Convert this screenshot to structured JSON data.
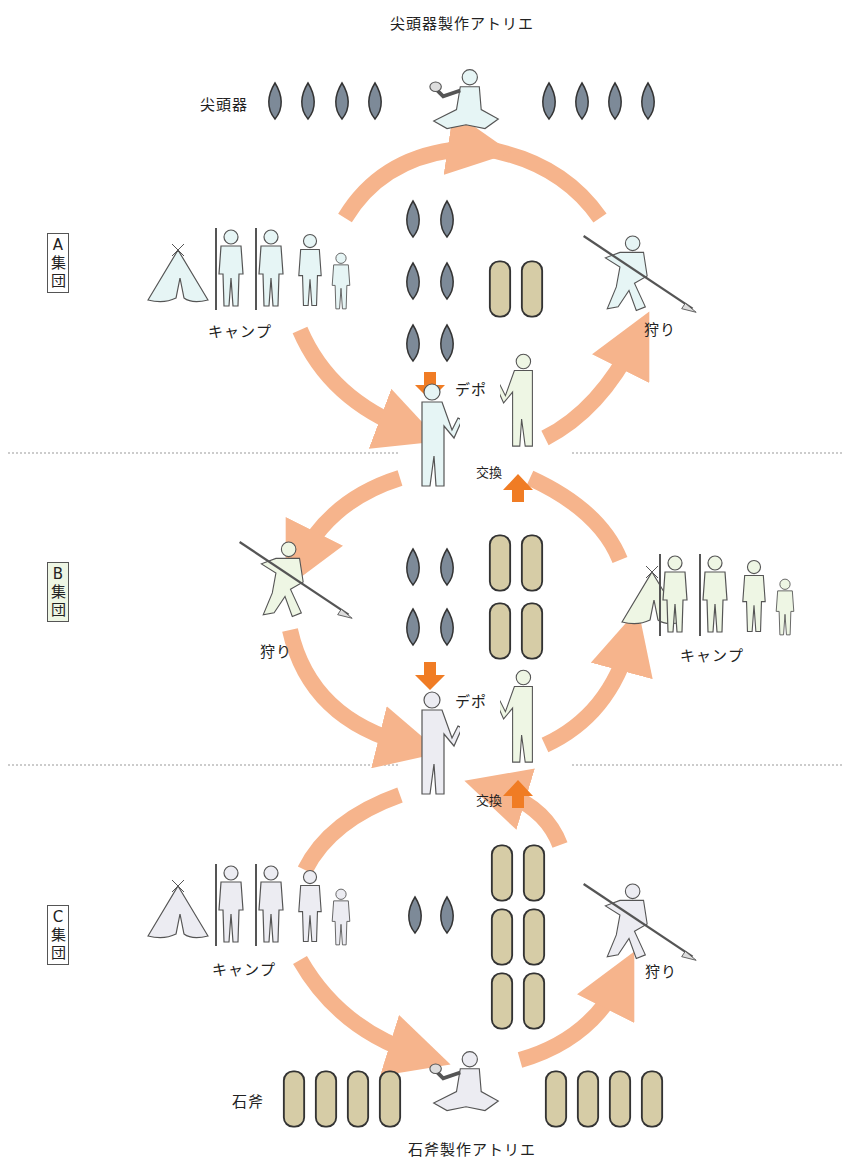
{
  "diagram": {
    "title_top": "尖頭器製作アトリエ",
    "title_bottom": "石斧製作アトリエ",
    "item_labels": {
      "point": "尖頭器",
      "axe": "石斧"
    },
    "groups": [
      {
        "id": "A",
        "letter": "A",
        "suffix1": "集",
        "suffix2": "団",
        "color": "#e6f5f5"
      },
      {
        "id": "B",
        "letter": "B",
        "suffix1": "集",
        "suffix2": "団",
        "color": "#eef6e4"
      },
      {
        "id": "C",
        "letter": "C",
        "suffix1": "集",
        "suffix2": "団",
        "color": "#ececf2"
      }
    ],
    "labels": {
      "camp": "キャンプ",
      "hunt": "狩り",
      "depot": "デポ",
      "exchange": "交換"
    },
    "colors": {
      "cycle_arrow": "#f6b48c",
      "exchange_arrow": "#f07c24",
      "point_fill": "#7d8a98",
      "axe_fill": "#d6cca6",
      "outline": "#333333",
      "divider": "#999999"
    },
    "counts": {
      "top_points_left": 4,
      "top_points_right": 4,
      "A_points": 6,
      "A_axes": 2,
      "B_points": 4,
      "B_axes": 4,
      "C_points": 2,
      "C_axes": 6,
      "bottom_axes_left": 4,
      "bottom_axes_right": 4
    }
  }
}
